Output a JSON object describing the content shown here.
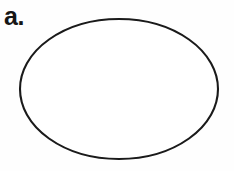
{
  "figure": {
    "panel_label": "a.",
    "background_color": "#fefefe",
    "width": 234,
    "height": 171,
    "caption": ""
  },
  "shapes": [
    {
      "name": "ellipse",
      "kind": "ellipse",
      "center_x": 119,
      "center_y": 89,
      "radius_x": 99,
      "radius_y": 70,
      "stroke_color": "#1a1a1a",
      "stroke_width": 2.1,
      "fill_color": "#ffffff"
    }
  ]
}
